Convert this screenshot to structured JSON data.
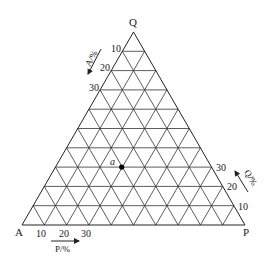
{
  "diagram": {
    "type": "ternary",
    "divisions": 10,
    "vertices": {
      "top": "Q",
      "left": "A",
      "right": "P"
    },
    "axes": {
      "left_edge": {
        "label": "A/%",
        "ticks": [
          "10",
          "20",
          "30"
        ]
      },
      "bottom_edge": {
        "label": "P/%",
        "ticks": [
          "10",
          "20",
          "30"
        ]
      },
      "right_edge": {
        "label": "Q/%",
        "ticks": [
          "10",
          "20",
          "30"
        ]
      }
    },
    "points": [
      {
        "label": "a",
        "A": 40,
        "P": 30,
        "Q": 30
      }
    ],
    "colors": {
      "line": "#333333",
      "text": "#1a1a1a",
      "point": "#000000",
      "background": "#ffffff"
    }
  }
}
